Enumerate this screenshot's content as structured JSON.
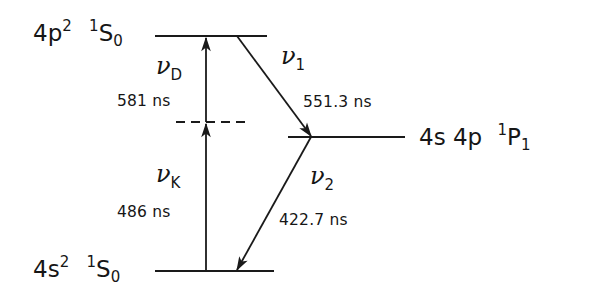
{
  "diagram": {
    "type": "energy-level-diagram",
    "levels": [
      {
        "id": "upper",
        "config": "4p",
        "config_sup": "2",
        "term_sup": "1",
        "term": "S",
        "term_sub": "0"
      },
      {
        "id": "middle",
        "config": "4s 4p",
        "config_sup": "",
        "term_sup": "1",
        "term": "P",
        "term_sub": "1"
      },
      {
        "id": "ground",
        "config": "4s",
        "config_sup": "2",
        "term_sup": "1",
        "term": "S",
        "term_sub": "0"
      }
    ],
    "transitions": [
      {
        "id": "nu_D",
        "symbol": "ν",
        "sub": "D",
        "wavelength": "581 ns",
        "from": "virtual",
        "to": "upper",
        "direction": "up"
      },
      {
        "id": "nu_K",
        "symbol": "ν",
        "sub": "K",
        "wavelength": "486 ns",
        "from": "ground",
        "to": "virtual",
        "direction": "up"
      },
      {
        "id": "nu_1",
        "symbol": "ν",
        "sub": "1",
        "wavelength": "551.3 ns",
        "from": "upper",
        "to": "middle",
        "direction": "down"
      },
      {
        "id": "nu_2",
        "symbol": "ν",
        "sub": "2",
        "wavelength": "422.7 ns",
        "from": "middle",
        "to": "ground",
        "direction": "down"
      }
    ],
    "virtual_level": {
      "style": "dashed"
    },
    "colors": {
      "line": "#1a1a1a",
      "background": "#ffffff"
    }
  }
}
